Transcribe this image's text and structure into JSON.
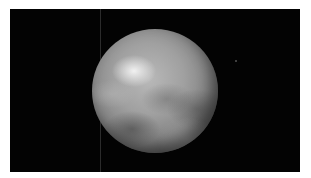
{
  "image": {
    "subject": "planet-sphere",
    "description": "Grayscale rendered sphere with mottled surface on black background",
    "background_color": "#030303",
    "border_color": "#ffffff",
    "colors": {
      "highlight": "#f5f5f5",
      "surface_mid": "#a0a0a0",
      "surface_dark": "#4a4a4a"
    }
  }
}
